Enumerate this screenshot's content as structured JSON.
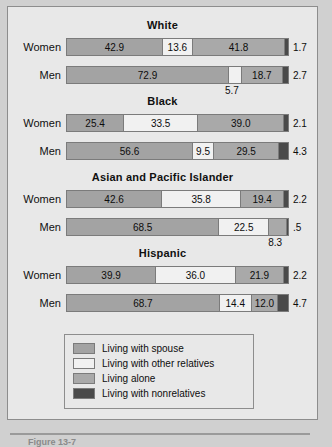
{
  "figure": {
    "caption": "Figure 13-7"
  },
  "legend": {
    "items": [
      {
        "key": "spouse",
        "label": "Living with spouse",
        "color": "#a3a3a3"
      },
      {
        "key": "other",
        "label": "Living with other relatives",
        "color": "#f1f1f1"
      },
      {
        "key": "alone",
        "label": "Living alone",
        "color": "#a9a9a9"
      },
      {
        "key": "nonrel",
        "label": "Living with nonrelatives",
        "color": "#4a4a4a"
      }
    ]
  },
  "chart_data": {
    "type": "bar",
    "orientation": "horizontal",
    "stacked": true,
    "normalized_percent": true,
    "title": "",
    "xlabel": "",
    "ylabel": "",
    "xlim": [
      0,
      100
    ],
    "grid": false,
    "legend_position": "bottom-center",
    "series": [
      {
        "name": "Living with spouse",
        "color": "#a3a3a3"
      },
      {
        "name": "Living with other relatives",
        "color": "#f1f1f1"
      },
      {
        "name": "Living alone",
        "color": "#a9a9a9"
      },
      {
        "name": "Living with nonrelatives",
        "color": "#4a4a4a"
      }
    ],
    "groups": [
      {
        "title": "White",
        "rows": [
          {
            "label": "Women",
            "segments": [
              {
                "series": "Living with spouse",
                "value": 42.9,
                "label": "42.9",
                "label_position": "inside"
              },
              {
                "series": "Living with other relatives",
                "value": 13.6,
                "label": "13.6",
                "label_position": "inside"
              },
              {
                "series": "Living alone",
                "value": 41.8,
                "label": "41.8",
                "label_position": "inside"
              },
              {
                "series": "Living with nonrelatives",
                "value": 1.7,
                "label": "1.7",
                "label_position": "right"
              }
            ]
          },
          {
            "label": "Men",
            "segments": [
              {
                "series": "Living with spouse",
                "value": 72.9,
                "label": "72.9",
                "label_position": "inside"
              },
              {
                "series": "Living with other relatives",
                "value": 5.7,
                "label": "5.7",
                "label_position": "below"
              },
              {
                "series": "Living alone",
                "value": 18.7,
                "label": "18.7",
                "label_position": "inside"
              },
              {
                "series": "Living with nonrelatives",
                "value": 2.7,
                "label": "2.7",
                "label_position": "right"
              }
            ]
          }
        ]
      },
      {
        "title": "Black",
        "rows": [
          {
            "label": "Women",
            "segments": [
              {
                "series": "Living with spouse",
                "value": 25.4,
                "label": "25.4",
                "label_position": "inside"
              },
              {
                "series": "Living with other relatives",
                "value": 33.5,
                "label": "33.5",
                "label_position": "inside"
              },
              {
                "series": "Living alone",
                "value": 39.0,
                "label": "39.0",
                "label_position": "inside"
              },
              {
                "series": "Living with nonrelatives",
                "value": 2.1,
                "label": "2.1",
                "label_position": "right"
              }
            ]
          },
          {
            "label": "Men",
            "segments": [
              {
                "series": "Living with spouse",
                "value": 56.6,
                "label": "56.6",
                "label_position": "inside"
              },
              {
                "series": "Living with other relatives",
                "value": 9.5,
                "label": "9.5",
                "label_position": "inside"
              },
              {
                "series": "Living alone",
                "value": 29.5,
                "label": "29.5",
                "label_position": "inside"
              },
              {
                "series": "Living with nonrelatives",
                "value": 4.3,
                "label": "4.3",
                "label_position": "right"
              }
            ]
          }
        ]
      },
      {
        "title": "Asian and Pacific Islander",
        "rows": [
          {
            "label": "Women",
            "segments": [
              {
                "series": "Living with spouse",
                "value": 42.6,
                "label": "42.6",
                "label_position": "inside"
              },
              {
                "series": "Living with other relatives",
                "value": 35.8,
                "label": "35.8",
                "label_position": "inside"
              },
              {
                "series": "Living alone",
                "value": 19.4,
                "label": "19.4",
                "label_position": "inside"
              },
              {
                "series": "Living with nonrelatives",
                "value": 2.2,
                "label": "2.2",
                "label_position": "right"
              }
            ]
          },
          {
            "label": "Men",
            "segments": [
              {
                "series": "Living with spouse",
                "value": 68.5,
                "label": "68.5",
                "label_position": "inside"
              },
              {
                "series": "Living with other relatives",
                "value": 22.5,
                "label": "22.5",
                "label_position": "inside"
              },
              {
                "series": "Living alone",
                "value": 8.3,
                "label": "8.3",
                "label_position": "below"
              },
              {
                "series": "Living with nonrelatives",
                "value": 0.5,
                "label": ".5",
                "label_position": "right"
              }
            ]
          }
        ]
      },
      {
        "title": "Hispanic",
        "rows": [
          {
            "label": "Women",
            "segments": [
              {
                "series": "Living with spouse",
                "value": 39.9,
                "label": "39.9",
                "label_position": "inside"
              },
              {
                "series": "Living with other relatives",
                "value": 36.0,
                "label": "36.0",
                "label_position": "inside"
              },
              {
                "series": "Living alone",
                "value": 21.9,
                "label": "21.9",
                "label_position": "inside"
              },
              {
                "series": "Living with nonrelatives",
                "value": 2.2,
                "label": "2.2",
                "label_position": "right"
              }
            ]
          },
          {
            "label": "Men",
            "segments": [
              {
                "series": "Living with spouse",
                "value": 68.7,
                "label": "68.7",
                "label_position": "inside"
              },
              {
                "series": "Living with other relatives",
                "value": 14.4,
                "label": "14.4",
                "label_position": "inside"
              },
              {
                "series": "Living alone",
                "value": 12.0,
                "label": "12.0",
                "label_position": "inside"
              },
              {
                "series": "Living with nonrelatives",
                "value": 4.7,
                "label": "4.7",
                "label_position": "right"
              }
            ]
          }
        ]
      }
    ]
  }
}
